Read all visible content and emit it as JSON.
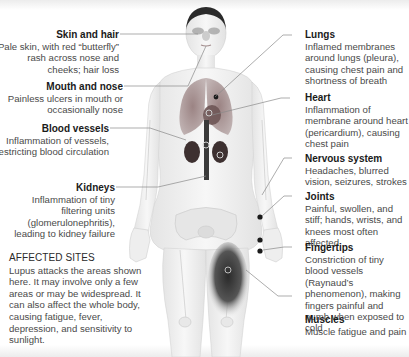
{
  "figure": {
    "colors": {
      "leader_line": "#8a8a8a",
      "marker": "#1a1a1a",
      "organ": "#6a5a5a",
      "skeleton": "#d8d8d8",
      "muscle_highlight": "#3a3a3a"
    }
  },
  "left_labels": [
    {
      "id": "skin-and-hair",
      "title": "Skin and hair",
      "text": "Pale skin, with red “butterfly” rash across nose and cheeks; hair loss"
    },
    {
      "id": "mouth-and-nose",
      "title": "Mouth and nose",
      "text": "Painless ulcers in mouth or occasionally nose"
    },
    {
      "id": "blood-vessels",
      "title": "Blood vessels",
      "text": "Inflammation of vessels, restricting blood circulation"
    },
    {
      "id": "kidneys",
      "title": "Kidneys",
      "text": "Inflammation of tiny filtering units (glomerulonephritis), leading to kidney failure"
    }
  ],
  "right_labels": [
    {
      "id": "lungs",
      "title": "Lungs",
      "text": "Inflamed membranes around lungs (pleura), causing chest pain and shortness of breath"
    },
    {
      "id": "heart",
      "title": "Heart",
      "text": "Inflammation of membrane around heart (pericardium), causing chest pain"
    },
    {
      "id": "nervous-system",
      "title": "Nervous system",
      "text": "Headaches, blurred vision, seizures, strokes"
    },
    {
      "id": "joints",
      "title": "Joints",
      "text": "Painful, swollen, and stiff; hands, wrists, and knees most often affected"
    },
    {
      "id": "fingertips",
      "title": "Fingertips",
      "text": "Constriction of tiny blood vessels (Raynaud’s phenomenon), making fingers painful and numb when exposed to cold"
    },
    {
      "id": "muscles",
      "title": "Muscles",
      "text": "Muscle fatigue and pain"
    }
  ],
  "affected_sites": {
    "heading": "AFFECTED SITES",
    "text": "Lupus attacks the areas shown here. It may involve only a few areas or may be widespread. It can also affect the whole body, causing fatigue, fever, depression, and sensitivity to sunlight."
  }
}
